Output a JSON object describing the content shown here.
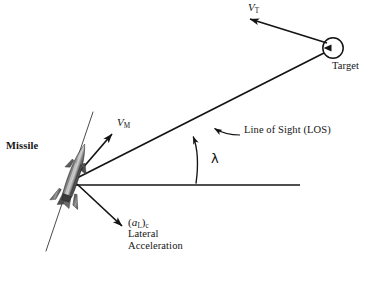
{
  "diagram": {
    "type": "vector-geometry-diagram",
    "background_color": "#ffffff",
    "stroke_color": "#141414",
    "missile_body_color": "#595959",
    "labels": {
      "missile": "Missile",
      "target": "Target",
      "line_of_sight": "Line of Sight (LOS)",
      "lambda": "λ",
      "target_velocity": {
        "symbol": "V",
        "subscript": "T"
      },
      "missile_velocity": {
        "symbol": "V",
        "subscript": "M"
      },
      "lateral_acceleration": {
        "symbol_open": "(",
        "symbol": "a",
        "subscript_inner": "L",
        "symbol_close": ")",
        "subscript_outer": "c",
        "line1": "Lateral",
        "line2": "Acceleration"
      }
    },
    "geometry": {
      "missile_origin": {
        "x": 72,
        "y": 180
      },
      "target_center": {
        "x": 333,
        "y": 48
      },
      "target_radius": 10,
      "horizontal_reference_line": {
        "x1": 72,
        "y1": 185,
        "x2": 300,
        "y2": 185
      },
      "los_line": {
        "x1": 72,
        "y1": 180,
        "x2": 324,
        "y2": 53
      },
      "missile_velocity_vector": {
        "x1": 74,
        "y1": 177,
        "x2": 114,
        "y2": 131
      },
      "target_velocity_vector": {
        "x1": 327,
        "y1": 43,
        "x2": 248,
        "y2": 18
      },
      "lateral_accel_vector": {
        "x1": 76,
        "y1": 184,
        "x2": 124,
        "y2": 228
      },
      "missile_axis_line": {
        "x1": 92,
        "y1": 113,
        "x2": 47,
        "y2": 250
      },
      "lambda_arc_radius": 120,
      "lambda_angle_degrees": 27
    }
  }
}
